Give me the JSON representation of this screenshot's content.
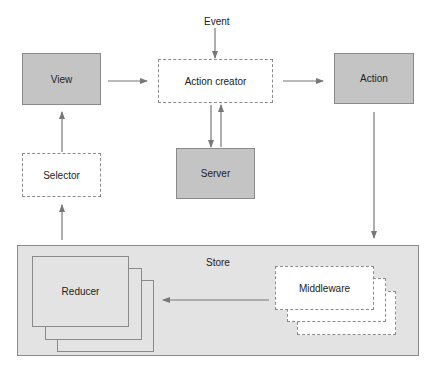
{
  "diagram": {
    "nodes": {
      "event": "Event",
      "view": "View",
      "action_creator": "Action creator",
      "action": "Action",
      "selector": "Selector",
      "server": "Server",
      "store": "Store",
      "reducer": "Reducer",
      "middleware": "Middleware"
    },
    "edges": [
      {
        "from": "Event",
        "to": "Action creator"
      },
      {
        "from": "View",
        "to": "Action creator"
      },
      {
        "from": "Action creator",
        "to": "Action"
      },
      {
        "from": "Action creator",
        "to": "Server"
      },
      {
        "from": "Server",
        "to": "Action creator"
      },
      {
        "from": "Action",
        "to": "Middleware"
      },
      {
        "from": "Middleware",
        "to": "Reducer"
      },
      {
        "from": "Store",
        "to": "Selector"
      },
      {
        "from": "Selector",
        "to": "View"
      }
    ],
    "colors": {
      "solid_fill": "#c4c4c4",
      "store_fill": "#e3e3e3",
      "stroke": "#8a8a8a",
      "arrow": "#777777"
    }
  }
}
